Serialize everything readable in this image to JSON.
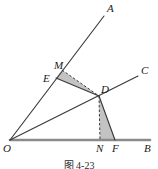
{
  "figure": {
    "caption": "图 4-23",
    "colors": {
      "stroke": "#3a3a3a",
      "baseline": "#8a8a8a",
      "shade_fill": "#b9b9b9",
      "label": "#1a1a1a"
    },
    "labels": {
      "A": "A",
      "B": "B",
      "C": "C",
      "D": "D",
      "E": "E",
      "F": "F",
      "M": "M",
      "N": "N",
      "O": "O"
    }
  },
  "chart_data": {
    "type": "diagram",
    "title": "图 4-23",
    "points": [
      {
        "name": "O",
        "x": 10,
        "y": 140,
        "label_x": 3,
        "label_y": 152
      },
      {
        "name": "A",
        "x": 104,
        "y": 16,
        "label_x": 107,
        "label_y": 12
      },
      {
        "name": "B",
        "x": 150,
        "y": 140,
        "label_x": 144,
        "label_y": 152
      },
      {
        "name": "C",
        "x": 138,
        "y": 76,
        "label_x": 141,
        "label_y": 74
      },
      {
        "name": "D",
        "x": 99,
        "y": 96,
        "label_x": 101,
        "label_y": 93
      },
      {
        "name": "E",
        "x": 56,
        "y": 78,
        "label_x": 43,
        "label_y": 82
      },
      {
        "name": "F",
        "x": 115,
        "y": 140,
        "label_x": 112,
        "label_y": 152
      },
      {
        "name": "M",
        "x": 62,
        "y": 70,
        "label_x": 54,
        "label_y": 69
      },
      {
        "name": "N",
        "x": 100,
        "y": 140,
        "label_x": 96,
        "label_y": 152
      }
    ],
    "solid_segments": [
      {
        "name": "ray-OA",
        "from": "O",
        "to": "A"
      },
      {
        "name": "ray-OC",
        "from": "O",
        "to": "C"
      },
      {
        "name": "segment-ED",
        "from": "E",
        "to": "D"
      },
      {
        "name": "segment-DF",
        "from": "D",
        "to": "F"
      },
      {
        "name": "baseline-OB",
        "from": "O",
        "to": "B"
      }
    ],
    "dashed_segments": [
      {
        "name": "segment-MD",
        "from": "M",
        "to": "D"
      },
      {
        "name": "segment-DN",
        "from": "D",
        "to": "N"
      }
    ],
    "shaded_regions": [
      {
        "name": "triangle-EMD",
        "vertices": [
          "E",
          "M",
          "D"
        ]
      },
      {
        "name": "triangle-DNF",
        "vertices": [
          "D",
          "N",
          "F"
        ]
      }
    ]
  }
}
